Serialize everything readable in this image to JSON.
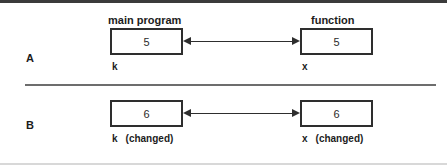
{
  "figure": {
    "rows": [
      {
        "letter": "A",
        "left": {
          "title": "main program",
          "value": "5",
          "var_label": "k",
          "note": ""
        },
        "right": {
          "title": "function",
          "value": "5",
          "var_label": "x",
          "note": ""
        }
      },
      {
        "letter": "B",
        "left": {
          "title": "",
          "value": "6",
          "var_label": "k",
          "note": "(changed)"
        },
        "right": {
          "title": "",
          "value": "6",
          "var_label": "x",
          "note": "(changed)"
        }
      }
    ],
    "colors": {
      "ink": "#2e2e2e",
      "rule_top": "#3b3b3b",
      "rule_mid": "#6d6d6d",
      "background": "#ffffff"
    }
  }
}
